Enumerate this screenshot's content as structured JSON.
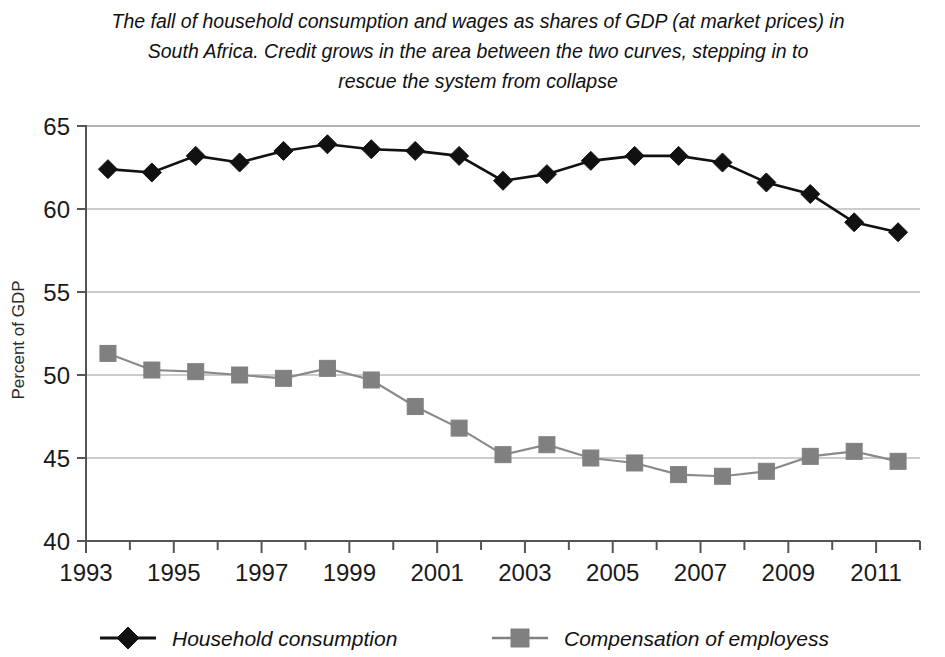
{
  "chart_data": {
    "type": "line",
    "title": "The fall of household consumption and wages as shares of GDP (at market prices) in South Africa. Credit grows in the area between the two curves, stepping in to rescue the system from collapse",
    "title_line1": "The fall of household consumption and wages as shares of GDP (at market prices) in",
    "title_line2": "South Africa. Credit grows in the area between the two curves, stepping in to",
    "title_line3": "rescue the system from collapse",
    "xlabel": "",
    "ylabel": "Percent of GDP",
    "ylim": [
      40,
      65
    ],
    "xlim": [
      1993,
      2012
    ],
    "y_ticks": [
      40,
      45,
      50,
      55,
      60,
      65
    ],
    "y_tick_labels": [
      "40",
      "45",
      "50",
      "55",
      "60",
      "65"
    ],
    "x_ticks": [
      1993,
      1994,
      1995,
      1996,
      1997,
      1998,
      1999,
      2000,
      2001,
      2002,
      2003,
      2004,
      2005,
      2006,
      2007,
      2008,
      2009,
      2010,
      2011,
      2012
    ],
    "x_tick_labels": [
      "1993",
      "",
      "1995",
      "",
      "1997",
      "",
      "1999",
      "",
      "2001",
      "",
      "2003",
      "",
      "2005",
      "",
      "2007",
      "",
      "2009",
      "",
      "2011",
      ""
    ],
    "grid": true,
    "grid_axis": "y",
    "legend_position": "bottom",
    "x": [
      1993.5,
      1994.5,
      1995.5,
      1996.5,
      1997.5,
      1998.5,
      1999.5,
      2000.5,
      2001.5,
      2002.5,
      2003.5,
      2004.5,
      2005.5,
      2006.5,
      2007.5,
      2008.5,
      2009.5,
      2010.5,
      2011.5
    ],
    "series": [
      {
        "name": "Household consumption",
        "marker": "diamond",
        "color": "#111111",
        "line_color": "#111111",
        "values": [
          62.4,
          62.2,
          63.2,
          62.8,
          63.5,
          63.9,
          63.6,
          63.5,
          63.2,
          61.7,
          62.1,
          62.9,
          63.2,
          63.2,
          62.8,
          61.6,
          60.9,
          59.2,
          58.6
        ]
      },
      {
        "name": "Compensation of employess",
        "marker": "square",
        "color": "#808080",
        "line_color": "#8a8a8a",
        "values": [
          51.3,
          50.3,
          50.2,
          50.0,
          49.8,
          50.4,
          49.7,
          48.1,
          46.8,
          45.2,
          45.8,
          45.0,
          44.7,
          44.0,
          43.9,
          44.2,
          45.1,
          45.4,
          44.8
        ]
      }
    ]
  },
  "legend": {
    "items": [
      {
        "label": "Household consumption",
        "marker": "diamond",
        "color": "#111111"
      },
      {
        "label": "Compensation of employess",
        "marker": "square",
        "color": "#808080"
      }
    ]
  }
}
